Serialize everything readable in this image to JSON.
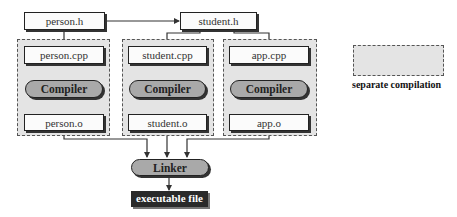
{
  "diagram": {
    "headers": [
      {
        "id": "person-h",
        "label": "person.h"
      },
      {
        "id": "student-h",
        "label": "student.h"
      }
    ],
    "groups": [
      {
        "source": "person.cpp",
        "compiler": "Compiler",
        "object": "person.o"
      },
      {
        "source": "student.cpp",
        "compiler": "Compiler",
        "object": "student.o"
      },
      {
        "source": "app.cpp",
        "compiler": "Compiler",
        "object": "app.o"
      }
    ],
    "linker": "Linker",
    "output": "executable file",
    "legend": {
      "label": "separate compilation"
    },
    "colors": {
      "group_fill": "#e4e4e4",
      "box_fill": "#fbfbfb",
      "pill_fill": "#a9a9a9",
      "exec_fill": "#2a2a2a",
      "line": "#333333"
    }
  }
}
